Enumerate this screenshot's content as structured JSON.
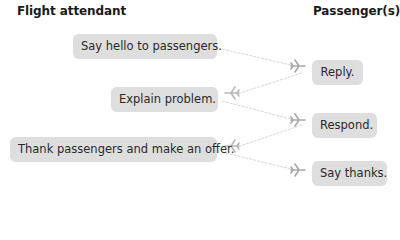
{
  "headings": {
    "left": "Flight attendant",
    "right": "Passenger(s)"
  },
  "attendant": [
    {
      "label": "Say hello to passengers."
    },
    {
      "label": "Explain problem."
    },
    {
      "label": "Thank passengers and make an offer."
    }
  ],
  "passenger": [
    {
      "label": "Reply."
    },
    {
      "label": "Respond."
    },
    {
      "label": "Say thanks."
    }
  ],
  "connectors": {
    "icon": "airplane-icon",
    "color": "#b0b0b0",
    "line_color": "#dcdcdc"
  },
  "colors": {
    "box_fill": "#dedede",
    "text": "#2a2a2a"
  }
}
